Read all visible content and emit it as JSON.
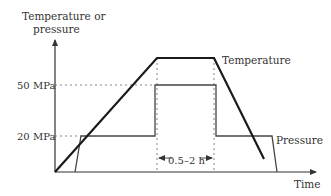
{
  "diagram": {
    "y_axis_label_line1": "Temperature or",
    "y_axis_label_line2": "pressure",
    "x_axis_label": "Time",
    "tick_50": "50 MPa",
    "tick_20": "20 MPa",
    "temperature_label": "Temperature",
    "pressure_label": "Pressure",
    "hold_time_label": "0.5–2 h",
    "colors": {
      "temperature_line": "#1a1a1a",
      "pressure_line": "#444444",
      "axis": "#333333",
      "guide": "#666666"
    }
  }
}
